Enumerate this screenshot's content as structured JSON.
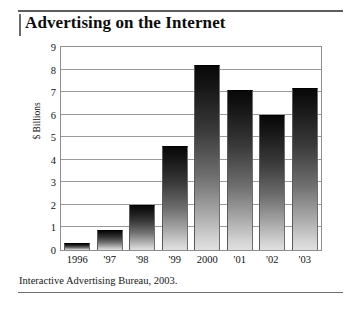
{
  "figure": {
    "title": "Advertising on the Internet",
    "source_note": "Interactive Advertising Bureau, 2003."
  },
  "chart_data": {
    "type": "bar",
    "title": "Advertising on the Internet",
    "xlabel": "",
    "ylabel": "$ Billions",
    "categories": [
      "1996",
      "'97",
      "'98",
      "'99",
      "2000",
      "'01",
      "'02",
      "'03"
    ],
    "values": [
      0.3,
      0.9,
      2.0,
      4.6,
      8.2,
      7.1,
      6.0,
      7.2
    ],
    "ylim": [
      0,
      9
    ],
    "ytick_labels": [
      "0",
      "1",
      "2",
      "3",
      "4",
      "5",
      "6",
      "7",
      "8",
      "9"
    ],
    "ytick_values": [
      0,
      1,
      2,
      3,
      4,
      5,
      6,
      7,
      8,
      9
    ],
    "grid": true,
    "legend": "none",
    "bar_fill": "vertical gradient black to light gray",
    "colors": {
      "bar_top": "#080808",
      "bar_bottom": "#e0e0e0",
      "gridline": "#9a9a9a",
      "frame": "#8e8e8e",
      "background": "#ffffff",
      "text": "#121212"
    }
  }
}
